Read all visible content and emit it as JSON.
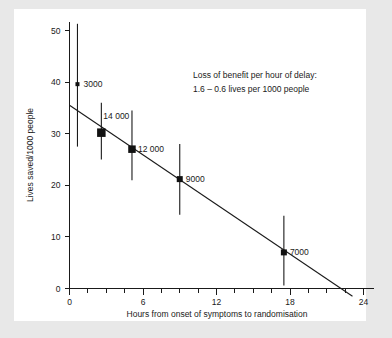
{
  "chart_data": {
    "type": "scatter",
    "title": "",
    "xlabel": "Hours from onset of symptoms to randomisation",
    "ylabel": "Lives saved/1000 people",
    "xlim": [
      0,
      24
    ],
    "ylim": [
      0,
      54
    ],
    "grid": false,
    "legend": "none",
    "x_ticks": [
      0,
      6,
      12,
      18,
      24
    ],
    "x_tick_labels": [
      "0",
      "6",
      "12",
      "18",
      "24"
    ],
    "x_minor_step": 1.5,
    "y_ticks": [
      0,
      10,
      20,
      30,
      40,
      50
    ],
    "y_tick_labels": [
      "0",
      "10",
      "20",
      "30",
      "40",
      "50"
    ],
    "points": [
      {
        "label": "3000",
        "x": 0.65,
        "y": 39.6,
        "ci_low": 27.5,
        "ci_high": 51.3,
        "marker_size": 4,
        "label_dx": 6,
        "label_dy": 3
      },
      {
        "label": "14 000",
        "x": 2.6,
        "y": 30.2,
        "ci_low": 25.0,
        "ci_high": 36.0,
        "marker_size": 8.5,
        "label_dx": 2,
        "label_dy": -14
      },
      {
        "label": "12 000",
        "x": 5.1,
        "y": 27.0,
        "ci_low": 21.0,
        "ci_high": 34.5,
        "marker_size": 7.5,
        "label_dx": 6,
        "label_dy": 3
      },
      {
        "label": "9000",
        "x": 9.0,
        "y": 21.2,
        "ci_low": 14.3,
        "ci_high": 28.0,
        "marker_size": 6,
        "label_dx": 6,
        "label_dy": 3
      },
      {
        "label": "7000",
        "x": 17.5,
        "y": 7.0,
        "ci_low": 0.6,
        "ci_high": 14.1,
        "marker_size": 6,
        "label_dx": 6,
        "label_dy": 3
      }
    ],
    "trend_line": {
      "x_start": 0,
      "y_start": 35.5,
      "x_end": 23.1,
      "y_end": -1.5,
      "slope": -1.6,
      "intercept": 35.5
    },
    "annotation": {
      "line1": "Loss of benefit per hour of delay:",
      "line2": "1.6 – 0.6 lives per 1000 people"
    }
  },
  "colors": {
    "figure_background": "#e8e8e8",
    "plot_background": "#ffffff",
    "ink": "#1a1a1a",
    "marker": "#111111"
  }
}
